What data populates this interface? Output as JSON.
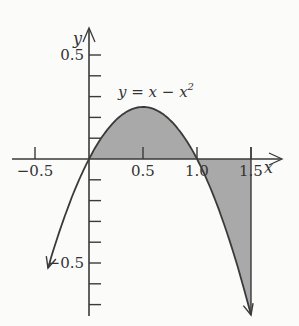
{
  "chart_data": {
    "type": "line",
    "title": "",
    "function": "y = x - x^2",
    "curve_label": "y = x − x",
    "curve_label_exponent": "2",
    "xlabel": "x",
    "ylabel": "y",
    "x_range_plotted": [
      -0.38,
      1.5
    ],
    "xlim": [
      -0.5,
      1.8
    ],
    "ylim": [
      -0.75,
      0.6
    ],
    "x_ticks": [
      -0.5,
      0.5,
      1.0,
      1.5
    ],
    "x_tick_labels": [
      "−0.5",
      "0.5",
      "1.0",
      "1.5"
    ],
    "y_ticks": [
      -0.7,
      -0.6,
      -0.5,
      -0.4,
      -0.3,
      -0.2,
      -0.1,
      0.1,
      0.2,
      0.3,
      0.4,
      0.5
    ],
    "y_tick_labels_shown": [
      "0.5",
      "−0.5"
    ],
    "shaded_regions": [
      {
        "from": 0,
        "to": 1,
        "sign": "positive",
        "description": "area between curve and x-axis above axis"
      },
      {
        "from": 1,
        "to": 1.5,
        "sign": "negative",
        "description": "area between curve and x-axis below axis"
      }
    ],
    "points": [
      {
        "x": -0.38,
        "y": -0.524
      },
      {
        "x": 0,
        "y": 0
      },
      {
        "x": 0.5,
        "y": 0.25
      },
      {
        "x": 1.0,
        "y": 0
      },
      {
        "x": 1.5,
        "y": -0.75
      }
    ],
    "grid": false,
    "legend": "none",
    "colors": {
      "fill": "#a9a9a9",
      "line": "#3a3a3a",
      "background": "#fbfbfa"
    }
  }
}
